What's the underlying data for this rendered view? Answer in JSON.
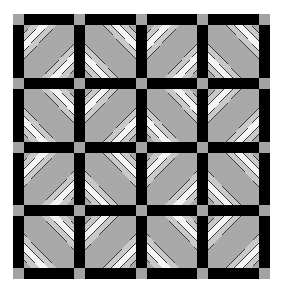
{
  "image": {
    "subject": "quilt pattern",
    "description": "4x4 grid of diagonally striped quilt blocks separated by black sashing with gray cornerstones",
    "grid": {
      "rows": 4,
      "cols": 4
    },
    "orientation_pattern": [
      [
        "fwd",
        "back",
        "fwd",
        "back"
      ],
      [
        "back",
        "fwd",
        "back",
        "fwd"
      ],
      [
        "fwd",
        "back",
        "fwd",
        "back"
      ],
      [
        "back",
        "fwd",
        "back",
        "fwd"
      ]
    ],
    "colors": {
      "background": "#ffffff",
      "sashing": "#000000",
      "cornerstone": "#a3a3a3",
      "stripe_medium": "#a9a9a9",
      "stripe_light": "#c9c9c9",
      "stripe_white": "#f4f4f4",
      "seam_line": "#3a3a3a"
    }
  }
}
